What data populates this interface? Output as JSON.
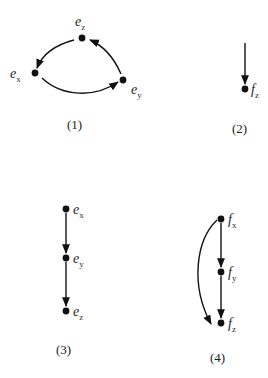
{
  "diagrams": [
    {
      "caption": "(1)",
      "nodes": [
        {
          "id": "ex",
          "base": "e",
          "sub": "x"
        },
        {
          "id": "ey",
          "base": "e",
          "sub": "y"
        },
        {
          "id": "ez",
          "base": "e",
          "sub": "z"
        }
      ],
      "edges": [
        {
          "from": "ex",
          "to": "ey",
          "shape": "curved"
        },
        {
          "from": "ey",
          "to": "ez",
          "shape": "curved"
        },
        {
          "from": "ez",
          "to": "ex",
          "shape": "curved"
        }
      ]
    },
    {
      "caption": "(2)",
      "nodes": [
        {
          "id": "fz",
          "base": "f",
          "sub": "z"
        }
      ],
      "edges": [
        {
          "from": "above",
          "to": "fz",
          "shape": "straight"
        }
      ]
    },
    {
      "caption": "(3)",
      "nodes": [
        {
          "id": "ex",
          "base": "e",
          "sub": "x"
        },
        {
          "id": "ey",
          "base": "e",
          "sub": "y"
        },
        {
          "id": "ez",
          "base": "e",
          "sub": "z"
        }
      ],
      "edges": [
        {
          "from": "ex",
          "to": "ey",
          "shape": "straight"
        },
        {
          "from": "ey",
          "to": "ez",
          "shape": "straight"
        }
      ]
    },
    {
      "caption": "(4)",
      "nodes": [
        {
          "id": "fx",
          "base": "f",
          "sub": "x"
        },
        {
          "id": "fy",
          "base": "f",
          "sub": "y"
        },
        {
          "id": "fz",
          "base": "f",
          "sub": "z"
        }
      ],
      "edges": [
        {
          "from": "fx",
          "to": "fy",
          "shape": "straight"
        },
        {
          "from": "fy",
          "to": "fz",
          "shape": "straight"
        },
        {
          "from": "fx",
          "to": "fz",
          "shape": "curved"
        }
      ]
    }
  ]
}
